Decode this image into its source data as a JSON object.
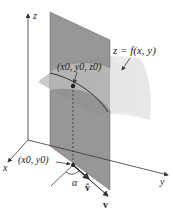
{
  "diagram": {
    "axes": {
      "z_label": "z",
      "x_label": "x",
      "y_label": "y"
    },
    "surface_label": "z = f(x, y)",
    "point_3d_label": "(x0, y0, z0)",
    "point_2d_label": "(x0, y0)",
    "angle_label": "α",
    "unit_vector_label": "v̂",
    "vector_label": "v",
    "colors": {
      "plane_fill": "#8c8c8c",
      "surface_fill": "#d9d9d9",
      "axis": "#333333",
      "text": "#222222"
    }
  }
}
